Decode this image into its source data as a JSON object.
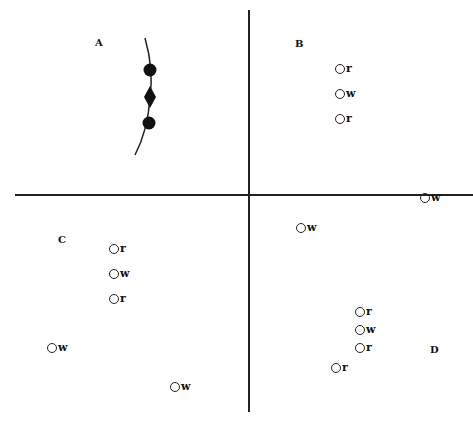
{
  "quadrants": {
    "A": {
      "label": "A",
      "x": 95,
      "y": 37
    },
    "B": {
      "label": "B",
      "x": 295,
      "y": 38
    },
    "C": {
      "label": "C",
      "x": 58,
      "y": 234
    },
    "D": {
      "label": "D",
      "x": 430,
      "y": 344
    }
  },
  "points": [
    {
      "label": "r",
      "x": 335,
      "y": 69
    },
    {
      "label": "w",
      "x": 335,
      "y": 94
    },
    {
      "label": "r",
      "x": 335,
      "y": 119
    },
    {
      "label": "w",
      "x": 420,
      "y": 198
    },
    {
      "label": "w",
      "x": 296,
      "y": 228
    },
    {
      "label": "r",
      "x": 109,
      "y": 249
    },
    {
      "label": "w",
      "x": 109,
      "y": 274
    },
    {
      "label": "r",
      "x": 109,
      "y": 299
    },
    {
      "label": "r",
      "x": 355,
      "y": 312
    },
    {
      "label": "w",
      "x": 355,
      "y": 330
    },
    {
      "label": "r",
      "x": 355,
      "y": 348
    },
    {
      "label": "r",
      "x": 331,
      "y": 368
    },
    {
      "label": "w",
      "x": 47,
      "y": 348
    },
    {
      "label": "w",
      "x": 170,
      "y": 387
    }
  ],
  "chain_A": {
    "markers": [
      "circle-filled",
      "diamond-filled",
      "circle-filled"
    ]
  }
}
